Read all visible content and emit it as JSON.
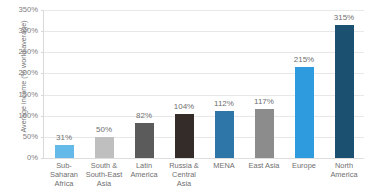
{
  "title_remnant": "· · · · · · ·",
  "chart_data": {
    "type": "bar",
    "title": "",
    "xlabel": "",
    "ylabel": "Average income (% world average)",
    "ylim": [
      0,
      350
    ],
    "ytick_values": [
      0,
      50,
      100,
      150,
      200,
      250,
      300,
      350
    ],
    "ytick_labels": [
      "0%",
      "50%",
      "100%",
      "150%",
      "200%",
      "250%",
      "300%",
      "350%"
    ],
    "grid": true,
    "legend": "none",
    "categories": [
      "Sub-Saharan Africa",
      "South & South-East Asia",
      "Latin America",
      "Russia & Central Asia",
      "MENA",
      "East Asia",
      "Europe",
      "North America"
    ],
    "category_lines": [
      [
        "Sub-Saharan",
        "Africa"
      ],
      [
        "South &",
        "South-East",
        "Asia"
      ],
      [
        "Latin",
        "America"
      ],
      [
        "Russia &",
        "Central Asia"
      ],
      [
        "MENA"
      ],
      [
        "East Asia"
      ],
      [
        "Europe"
      ],
      [
        "North",
        "America"
      ]
    ],
    "values": [
      31,
      50,
      82,
      104,
      112,
      117,
      215,
      315
    ],
    "value_labels": [
      "31%",
      "50%",
      "82%",
      "104%",
      "112%",
      "117%",
      "215%",
      "315%"
    ],
    "bar_colors": [
      "#63B9E8",
      "#BFBFBF",
      "#5B5B5B",
      "#332C29",
      "#2E76A8",
      "#8C8C8C",
      "#2E9BDE",
      "#1C5070"
    ]
  },
  "colors": {
    "gridline": "#e8e8e8",
    "axis": "#d9d9d9",
    "text": "#6f6f6f",
    "background": "#ffffff"
  }
}
